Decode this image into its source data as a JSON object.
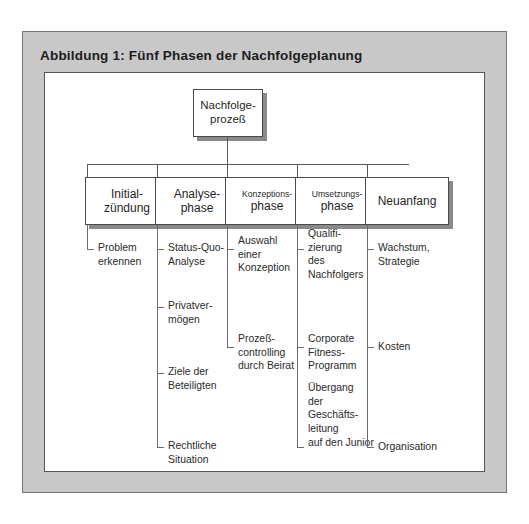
{
  "figure": {
    "title": "Abbildung 1: Fünf Phasen der Nachfolgeplanung",
    "root": {
      "line1": "Nachfolge-",
      "line2": "prozeß"
    },
    "colors": {
      "frame_fill": "#c8c8c8",
      "frame_border": "#777777",
      "canvas_fill": "#ffffff",
      "canvas_border": "#555555",
      "box_border": "#4a4a4a",
      "box_shadow": "#8a8a8a",
      "connector": "#5a5a5a",
      "text": "#1f1f1f"
    },
    "columns": [
      {
        "box": {
          "line1": "Initial-",
          "line2": "zündung"
        },
        "leaves": [
          "Problem\nerkennen"
        ]
      },
      {
        "box": {
          "line1": "Analyse-",
          "line2": "phase"
        },
        "leaves": [
          "Status-Quo-\nAnalyse",
          "Privatver-\nmögen",
          "Ziele der\nBeteiligten",
          "Rechtliche\nSituation"
        ]
      },
      {
        "box": {
          "line1": "Konzeptions-",
          "line2": "phase"
        },
        "leaves": [
          "Auswahl\neiner\nKonzeption",
          "Prozeß-\ncontrolling\ndurch Beirat"
        ]
      },
      {
        "box": {
          "line1": "Umsetzungs-",
          "line2": "phase"
        },
        "leaves": [
          "Qualifi-\nzierung\ndes\nNachfolgers",
          "Corporate\nFitness-\nProgramm",
          "Übergang\nder\nGeschäfts-\nleitung\nauf den Junior"
        ]
      },
      {
        "box": {
          "line1": "Neuanfang",
          "line2": ""
        },
        "leaves": [
          "Wachstum,\nStrategie",
          "Kosten",
          "Organisation"
        ]
      }
    ]
  }
}
